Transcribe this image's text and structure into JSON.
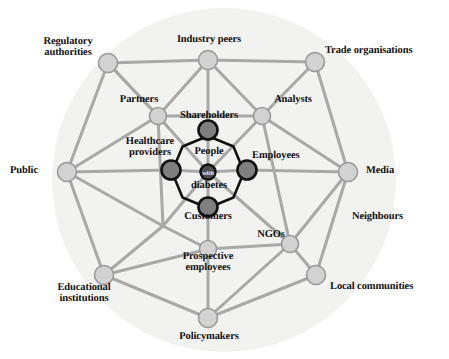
{
  "figure": {
    "center_label_line1": "People",
    "center_label_line2": "with",
    "center_label_line3": "diabetes",
    "background_tint": "#f2f2f0",
    "outer_node_fill": "#d2d2d2",
    "outer_node_stroke": "#9a9a9a",
    "inner_node_fill": "#7f7f7f",
    "inner_node_stroke": "#111111",
    "center_node_fill": "#4d4d4d",
    "center_node_stroke": "#111111",
    "link_color": "#a8a8a8",
    "inner_ring_color": "#111111",
    "text_color": "#101010"
  },
  "rings": {
    "inner": {
      "name": "inner-ring",
      "nodes": [
        {
          "id": "shareholders",
          "label": "Shareholders",
          "x": 208,
          "y": 130,
          "r": 9.5,
          "tone": "dark"
        },
        {
          "id": "employees",
          "label": "Employees",
          "x": 247,
          "y": 170,
          "r": 9.5,
          "tone": "dark"
        },
        {
          "id": "customers",
          "label": "Customers",
          "x": 208,
          "y": 207,
          "r": 9.5,
          "tone": "dark"
        },
        {
          "id": "healthcare-providers",
          "label": "Healthcare\nproviders",
          "x": 171,
          "y": 170,
          "r": 9.5,
          "tone": "dark"
        }
      ]
    },
    "middle": {
      "name": "middle-ring",
      "nodes": [
        {
          "id": "partners",
          "label": "Partners",
          "x": 158,
          "y": 116,
          "r": 8.5,
          "tone": "light"
        },
        {
          "id": "analysts",
          "label": "Analysts",
          "x": 262,
          "y": 116,
          "r": 8.5,
          "tone": "light"
        },
        {
          "id": "ngos",
          "label": "NGOs",
          "x": 290,
          "y": 244,
          "r": 8.5,
          "tone": "light"
        },
        {
          "id": "prospective-employees",
          "label": "Prospective\nemployees",
          "x": 208,
          "y": 249,
          "r": 8.5,
          "tone": "light"
        }
      ]
    },
    "outer": {
      "name": "outer-ring",
      "nodes": [
        {
          "id": "industry-peers",
          "label": "Industry peers",
          "x": 208,
          "y": 60,
          "r": 9.5,
          "tone": "light"
        },
        {
          "id": "trade-organisations",
          "label": "Trade organisations",
          "x": 315,
          "y": 62,
          "r": 9.5,
          "tone": "light"
        },
        {
          "id": "media",
          "label": "Media",
          "x": 348,
          "y": 172,
          "r": 9.5,
          "tone": "light"
        },
        {
          "id": "local-communities",
          "label": "Local communities",
          "x": 316,
          "y": 275,
          "r": 9.5,
          "tone": "light"
        },
        {
          "id": "policymakers",
          "label": "Policymakers",
          "x": 208,
          "y": 318,
          "r": 9.5,
          "tone": "light"
        },
        {
          "id": "educational-institutions",
          "label": "Educational\ninstitutions",
          "x": 104,
          "y": 275,
          "r": 9.5,
          "tone": "light"
        },
        {
          "id": "public",
          "label": "Public",
          "x": 67,
          "y": 172,
          "r": 9.5,
          "tone": "light"
        },
        {
          "id": "regulatory-authorities",
          "label": "Regulatory\nauthorities",
          "x": 108,
          "y": 63,
          "r": 9.5,
          "tone": "light"
        }
      ]
    },
    "unanchored": {
      "name": "label-only",
      "nodes": [
        {
          "id": "neighbours",
          "label": "Neighbours",
          "x": 390,
          "y": 222,
          "r": 0,
          "tone": "none"
        }
      ]
    }
  },
  "labels": [
    {
      "id": "label-industry-peers",
      "text": "Industry peers",
      "x": 171,
      "y": 34,
      "align": "center",
      "w": 76,
      "cls": "lbl-outer"
    },
    {
      "id": "label-trade-organisations",
      "text": "Trade organisations",
      "x": 325,
      "y": 45,
      "align": "left",
      "w": 124,
      "cls": "lbl-outer"
    },
    {
      "id": "label-media",
      "text": "Media",
      "x": 366,
      "y": 165,
      "align": "left",
      "w": 60,
      "cls": "lbl-outer"
    },
    {
      "id": "label-neighbours",
      "text": "Neighbours",
      "x": 352,
      "y": 211,
      "align": "left",
      "w": 78,
      "cls": "lbl-outer"
    },
    {
      "id": "label-local-communities",
      "text": "Local communities",
      "x": 330,
      "y": 281,
      "align": "left",
      "w": 118,
      "cls": "lbl-outer"
    },
    {
      "id": "label-policymakers",
      "text": "Policymakers",
      "x": 170,
      "y": 331,
      "align": "center",
      "w": 78,
      "cls": "lbl-outer"
    },
    {
      "id": "label-educational-institutions",
      "text": "Educational\ninstitutions",
      "x": 38,
      "y": 282,
      "align": "center",
      "w": 92,
      "cls": "lbl-outer"
    },
    {
      "id": "label-public",
      "text": "Public",
      "x": 10,
      "y": 165,
      "align": "left",
      "w": 48,
      "cls": "lbl-outer"
    },
    {
      "id": "label-regulatory-authorities",
      "text": "Regulatory\nauthorities",
      "x": 26,
      "y": 36,
      "align": "center",
      "w": 84,
      "cls": "lbl-outer"
    },
    {
      "id": "label-partners",
      "text": "Partners",
      "x": 108,
      "y": 94,
      "align": "center",
      "w": 62,
      "cls": "lbl-middle"
    },
    {
      "id": "label-analysts",
      "text": "Analysts",
      "x": 262,
      "y": 94,
      "align": "center",
      "w": 62,
      "cls": "lbl-middle"
    },
    {
      "id": "label-ngos",
      "text": "NGOs",
      "x": 249,
      "y": 229,
      "align": "center",
      "w": 44,
      "cls": "lbl-middle"
    },
    {
      "id": "label-prospective-employees",
      "text": "Prospective\nemployees",
      "x": 165,
      "y": 251,
      "align": "center",
      "w": 86,
      "cls": "lbl-middle"
    },
    {
      "id": "label-shareholders",
      "text": "Shareholders",
      "x": 170,
      "y": 110,
      "align": "center",
      "w": 78,
      "cls": "lbl-inner"
    },
    {
      "id": "label-employees",
      "text": "Employees",
      "x": 252,
      "y": 150,
      "align": "left",
      "w": 66,
      "cls": "lbl-inner"
    },
    {
      "id": "label-customers",
      "text": "Customers",
      "x": 172,
      "y": 211,
      "align": "center",
      "w": 72,
      "cls": "lbl-inner"
    },
    {
      "id": "label-healthcare-providers",
      "text": "Healthcare\nproviders",
      "x": 111,
      "y": 136,
      "align": "center",
      "w": 78,
      "cls": "lbl-inner"
    }
  ],
  "center": {
    "node": {
      "id": "people-with-diabetes",
      "x": 208,
      "y": 172,
      "r": 7.5
    },
    "text_top": "People",
    "text_mid": "with",
    "text_bottom": "diabetes",
    "top_pos": {
      "x": 180,
      "y": 146,
      "w": 58
    },
    "mid_pos": {
      "x": 196,
      "y": 169,
      "w": 24
    },
    "bottom_pos": {
      "x": 176,
      "y": 180,
      "w": 66
    }
  },
  "background_circle": {
    "cx": 224,
    "cy": 180,
    "r": 172
  }
}
